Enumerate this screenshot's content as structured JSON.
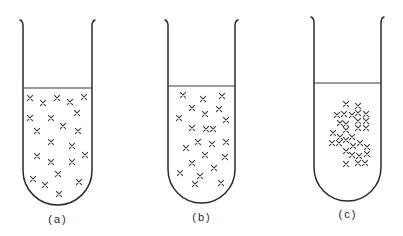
{
  "figure": {
    "stroke_color": "#2a2a2a",
    "background": "#ffffff"
  },
  "tubes": [
    {
      "id": "a",
      "label": "(a)",
      "pattern": "evenly dispersed",
      "geometry": {
        "left": 23,
        "right": 92,
        "top": 20,
        "liquid_y": 88,
        "bottom": 205
      },
      "label_pos": {
        "x": 58,
        "y": 213
      },
      "particles": [
        [
          30,
          98
        ],
        [
          43,
          103
        ],
        [
          57,
          98
        ],
        [
          70,
          102
        ],
        [
          84,
          97
        ],
        [
          30,
          118
        ],
        [
          51,
          118
        ],
        [
          77,
          113
        ],
        [
          37,
          131
        ],
        [
          63,
          126
        ],
        [
          78,
          131
        ],
        [
          51,
          142
        ],
        [
          72,
          146
        ],
        [
          37,
          156
        ],
        [
          51,
          162
        ],
        [
          72,
          162
        ],
        [
          85,
          155
        ],
        [
          58,
          174
        ],
        [
          33,
          179
        ],
        [
          45,
          185
        ],
        [
          79,
          182
        ],
        [
          59,
          194
        ]
      ]
    },
    {
      "id": "b",
      "label": "(b)",
      "pattern": "slightly grouped",
      "geometry": {
        "left": 168,
        "right": 235,
        "top": 20,
        "liquid_y": 86,
        "bottom": 203
      },
      "label_pos": {
        "x": 202,
        "y": 211
      },
      "particles": [
        [
          183,
          95
        ],
        [
          203,
          99
        ],
        [
          222,
          96
        ],
        [
          192,
          108
        ],
        [
          205,
          114
        ],
        [
          219,
          109
        ],
        [
          179,
          118
        ],
        [
          226,
          120
        ],
        [
          192,
          128
        ],
        [
          206,
          129
        ],
        [
          213,
          129
        ],
        [
          198,
          142
        ],
        [
          212,
          144
        ],
        [
          226,
          142
        ],
        [
          186,
          148
        ],
        [
          205,
          155
        ],
        [
          225,
          157
        ],
        [
          192,
          163
        ],
        [
          214,
          168
        ],
        [
          180,
          173
        ],
        [
          200,
          176
        ],
        [
          195,
          184
        ],
        [
          221,
          183
        ]
      ]
    },
    {
      "id": "c",
      "label": "(c)",
      "pattern": "aggregated cluster",
      "geometry": {
        "left": 314,
        "right": 381,
        "top": 17,
        "liquid_y": 83,
        "bottom": 201
      },
      "label_pos": {
        "x": 348,
        "y": 208
      },
      "particles": [
        [
          346,
          104
        ],
        [
          358,
          106
        ],
        [
          337,
          115
        ],
        [
          344,
          114
        ],
        [
          352,
          115
        ],
        [
          358,
          113
        ],
        [
          366,
          114
        ],
        [
          340,
          123
        ],
        [
          346,
          124
        ],
        [
          358,
          121
        ],
        [
          366,
          121
        ],
        [
          346,
          130
        ],
        [
          358,
          128
        ],
        [
          366,
          128
        ],
        [
          333,
          133
        ],
        [
          340,
          137
        ],
        [
          352,
          137
        ],
        [
          346,
          140
        ],
        [
          332,
          143
        ],
        [
          339,
          143
        ],
        [
          353,
          146
        ],
        [
          360,
          143
        ],
        [
          367,
          147
        ],
        [
          346,
          151
        ],
        [
          352,
          155
        ],
        [
          359,
          156
        ],
        [
          367,
          154
        ],
        [
          346,
          164
        ],
        [
          358,
          163
        ],
        [
          365,
          163
        ]
      ]
    }
  ]
}
